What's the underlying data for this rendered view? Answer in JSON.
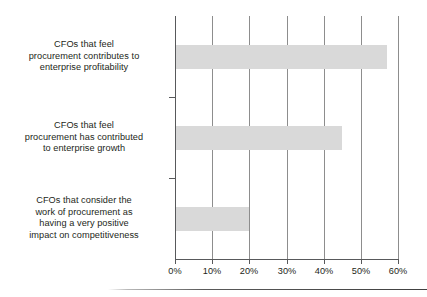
{
  "chart_data": {
    "type": "bar",
    "orientation": "horizontal",
    "title": "",
    "subtitle": "",
    "xlabel": "",
    "ylabel": "",
    "categories": [
      "CFOs that feel procurement contributes to enterprise profitability",
      "CFOs that feel procurement has contributed to enterprise growth",
      "CFOs that consider the work of procurement as having a very positive impact on competitiveness"
    ],
    "category_lines": [
      [
        "CFOs that feel",
        "procurement contributes to",
        "enterprise profitability"
      ],
      [
        "CFOs that feel",
        "procurement has contributed",
        "to enterprise growth"
      ],
      [
        "CFOs that consider the",
        "work of procurement as",
        "having a very positive",
        "impact on competitiveness"
      ]
    ],
    "values": [
      57,
      45,
      20
    ],
    "value_labels": [
      "57%",
      "45%",
      "20%"
    ],
    "xlim": [
      0,
      60
    ],
    "xticks": [
      0,
      10,
      20,
      30,
      40,
      50,
      60
    ],
    "xtick_labels": [
      "0%",
      "10%",
      "20%",
      "30%",
      "40%",
      "50%",
      "60%"
    ],
    "grid": "vertical",
    "legend": "none",
    "bar_color": "#d9d9d9",
    "axis_color": "#58595b",
    "gridline_color": "#8d8d8d",
    "text_color": "#231f20"
  }
}
